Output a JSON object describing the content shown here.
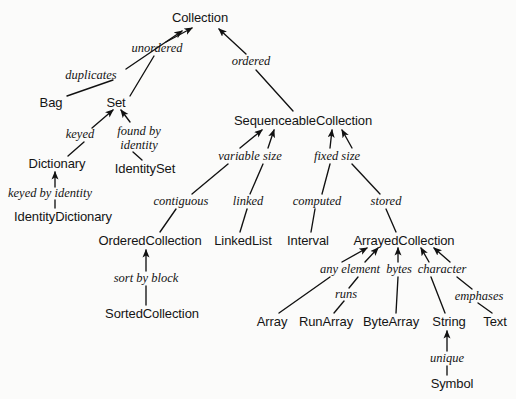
{
  "diagram": {
    "type": "tree-graph",
    "stroke_color": "#111111",
    "text_color": "#141414",
    "background_color": "#fbfbfa",
    "nodes": [
      {
        "id": "collection",
        "label": "Collection",
        "x": 200,
        "y": 17
      },
      {
        "id": "bag",
        "label": "Bag",
        "x": 51,
        "y": 102
      },
      {
        "id": "set",
        "label": "Set",
        "x": 116,
        "y": 102
      },
      {
        "id": "dictionary",
        "label": "Dictionary",
        "x": 57,
        "y": 163
      },
      {
        "id": "identityset",
        "label": "IdentitySet",
        "x": 145,
        "y": 168
      },
      {
        "id": "identitydictionary",
        "label": "IdentityDictionary",
        "x": 63,
        "y": 216
      },
      {
        "id": "sequenceablecollection",
        "label": "SequenceableCollection",
        "x": 303,
        "y": 120
      },
      {
        "id": "orderedcollection",
        "label": "OrderedCollection",
        "x": 150,
        "y": 240
      },
      {
        "id": "sortedcollection",
        "label": "SortedCollection",
        "x": 152,
        "y": 313
      },
      {
        "id": "linkedlist",
        "label": "LinkedList",
        "x": 243,
        "y": 240
      },
      {
        "id": "interval",
        "label": "Interval",
        "x": 308,
        "y": 240
      },
      {
        "id": "arrayedcollection",
        "label": "ArrayedCollection",
        "x": 404,
        "y": 240
      },
      {
        "id": "array",
        "label": "Array",
        "x": 272,
        "y": 321
      },
      {
        "id": "runarray",
        "label": "RunArray",
        "x": 326,
        "y": 321
      },
      {
        "id": "bytearray",
        "label": "ByteArray",
        "x": 391,
        "y": 321
      },
      {
        "id": "string",
        "label": "String",
        "x": 449,
        "y": 321
      },
      {
        "id": "text",
        "label": "Text",
        "x": 495,
        "y": 321
      },
      {
        "id": "symbol",
        "label": "Symbol",
        "x": 452,
        "y": 383
      }
    ],
    "edge_labels": [
      {
        "id": "duplicates",
        "label": "duplicates",
        "x": 91,
        "y": 75
      },
      {
        "id": "unordered",
        "label": "unordered",
        "x": 157,
        "y": 48
      },
      {
        "id": "ordered",
        "label": "ordered",
        "x": 251,
        "y": 61
      },
      {
        "id": "keyed",
        "label": "keyed",
        "x": 80,
        "y": 134
      },
      {
        "id": "found-by-identity",
        "label": "found by\nidentity",
        "x": 139,
        "y": 138
      },
      {
        "id": "keyed-by-identity",
        "label": "keyed by identity",
        "x": 50,
        "y": 193
      },
      {
        "id": "variable-size",
        "label": "variable size",
        "x": 250,
        "y": 156
      },
      {
        "id": "fixed-size",
        "label": "fixed size",
        "x": 337,
        "y": 156
      },
      {
        "id": "contiguous",
        "label": "contiguous",
        "x": 181,
        "y": 201
      },
      {
        "id": "linked",
        "label": "linked",
        "x": 248,
        "y": 201
      },
      {
        "id": "computed",
        "label": "computed",
        "x": 317,
        "y": 201
      },
      {
        "id": "stored",
        "label": "stored",
        "x": 386,
        "y": 201
      },
      {
        "id": "sort-by-block",
        "label": "sort by block",
        "x": 146,
        "y": 278
      },
      {
        "id": "any-element",
        "label": "any element",
        "x": 350,
        "y": 269
      },
      {
        "id": "bytes",
        "label": "bytes",
        "x": 399,
        "y": 269
      },
      {
        "id": "character",
        "label": "character",
        "x": 442,
        "y": 269
      },
      {
        "id": "runs",
        "label": "runs",
        "x": 346,
        "y": 294
      },
      {
        "id": "emphases",
        "label": "emphases",
        "x": 479,
        "y": 296
      },
      {
        "id": "unique",
        "label": "unique",
        "x": 447,
        "y": 358
      }
    ],
    "edges": [
      {
        "id": "bag-duplicates",
        "from": "bag",
        "to": "duplicates-label",
        "arrow": false,
        "x1": 67,
        "y1": 96,
        "x2": 113,
        "y2": 80
      },
      {
        "id": "duplicates-collection",
        "from": "duplicates",
        "to": "collection",
        "arrow": true,
        "x1": 126,
        "y1": 69,
        "x2": 182,
        "y2": 31
      },
      {
        "id": "set-unordered",
        "from": "set",
        "to": "unordered-label",
        "arrow": false,
        "x1": 130,
        "y1": 96,
        "x2": 154,
        "y2": 56
      },
      {
        "id": "unordered-collection",
        "from": "unordered",
        "to": "collection",
        "arrow": true,
        "x1": 166,
        "y1": 42,
        "x2": 192,
        "y2": 28
      },
      {
        "id": "sequenceable-ordered",
        "from": "sequenceablecollection",
        "to": "ordered-label",
        "arrow": false,
        "x1": 293,
        "y1": 111,
        "x2": 256,
        "y2": 70
      },
      {
        "id": "ordered-collection",
        "from": "ordered",
        "to": "collection",
        "arrow": true,
        "x1": 246,
        "y1": 54,
        "x2": 219,
        "y2": 29
      },
      {
        "id": "dictionary-keyed",
        "from": "dictionary",
        "to": "keyed-label",
        "arrow": false,
        "x1": 68,
        "y1": 156,
        "x2": 84,
        "y2": 142
      },
      {
        "id": "keyed-set",
        "from": "keyed",
        "to": "set",
        "arrow": true,
        "x1": 92,
        "y1": 128,
        "x2": 113,
        "y2": 110
      },
      {
        "id": "identityset-found",
        "from": "identityset",
        "to": "found-by-identity",
        "arrow": false,
        "x1": 142,
        "y1": 160,
        "x2": 133,
        "y2": 152
      },
      {
        "id": "found-set",
        "from": "found-by-identity",
        "to": "set",
        "arrow": true,
        "x1": 130,
        "y1": 122,
        "x2": 121,
        "y2": 110
      },
      {
        "id": "identitydict-label",
        "from": "identitydictionary",
        "to": "keyed-by-identity",
        "arrow": false,
        "x1": 55,
        "y1": 208,
        "x2": 55,
        "y2": 200
      },
      {
        "id": "keyedbyidentity-dictionary",
        "from": "keyed-by-identity",
        "to": "dictionary",
        "arrow": true,
        "x1": 55,
        "y1": 187,
        "x2": 55,
        "y2": 172
      },
      {
        "id": "contiguous-variablesize",
        "from": "contiguous",
        "to": "variable-size",
        "arrow": false,
        "x1": 192,
        "y1": 194,
        "x2": 228,
        "y2": 164
      },
      {
        "id": "variablesize-sequenceable",
        "from": "variable-size",
        "to": "sequenceablecollection",
        "arrow": true,
        "x1": 240,
        "y1": 148,
        "x2": 262,
        "y2": 130
      },
      {
        "id": "linked-variablesize2",
        "from": "linked",
        "to": "variable-size2",
        "arrow": false,
        "x1": 250,
        "y1": 194,
        "x2": 263,
        "y2": 164
      },
      {
        "id": "variablesize2-sequenceable",
        "from": "variable-size",
        "to": "sequenceablecollection",
        "arrow": true,
        "x1": 268,
        "y1": 148,
        "x2": 274,
        "y2": 130
      },
      {
        "id": "computed-fixedsize",
        "from": "computed",
        "to": "fixed-size",
        "arrow": false,
        "x1": 322,
        "y1": 194,
        "x2": 330,
        "y2": 164
      },
      {
        "id": "fixedsize-sequenceable",
        "from": "fixed-size",
        "to": "sequenceablecollection",
        "arrow": true,
        "x1": 330,
        "y1": 148,
        "x2": 332,
        "y2": 130
      },
      {
        "id": "stored-fixedsize",
        "from": "stored",
        "to": "fixed-size2",
        "arrow": false,
        "x1": 380,
        "y1": 194,
        "x2": 352,
        "y2": 164
      },
      {
        "id": "fixedsize2-sequenceable",
        "from": "fixed-size",
        "to": "sequenceablecollection",
        "arrow": true,
        "x1": 352,
        "y1": 148,
        "x2": 342,
        "y2": 130
      },
      {
        "id": "orderedcollection-contiguous",
        "from": "orderedcollection",
        "to": "contiguous",
        "arrow": false,
        "x1": 160,
        "y1": 232,
        "x2": 176,
        "y2": 209
      },
      {
        "id": "linkedlist-linked",
        "from": "linkedlist",
        "to": "linked",
        "arrow": false,
        "x1": 240,
        "y1": 232,
        "x2": 247,
        "y2": 209
      },
      {
        "id": "interval-computed",
        "from": "interval",
        "to": "computed",
        "arrow": false,
        "x1": 311,
        "y1": 232,
        "x2": 315,
        "y2": 209
      },
      {
        "id": "arrayedcollection-stored",
        "from": "arrayedcollection",
        "to": "stored",
        "arrow": false,
        "x1": 396,
        "y1": 232,
        "x2": 386,
        "y2": 209
      },
      {
        "id": "sortedcollection-sortbyblock",
        "from": "sortedcollection",
        "to": "sort-by-block",
        "arrow": false,
        "x1": 146,
        "y1": 305,
        "x2": 146,
        "y2": 286
      },
      {
        "id": "sortbyblock-orderedcollection",
        "from": "sort-by-block",
        "to": "orderedcollection",
        "arrow": true,
        "x1": 146,
        "y1": 271,
        "x2": 146,
        "y2": 250
      },
      {
        "id": "array-anyelement",
        "from": "array",
        "to": "any-element",
        "arrow": false,
        "x1": 279,
        "y1": 313,
        "x2": 330,
        "y2": 277
      },
      {
        "id": "anyelement-arrayed",
        "from": "any-element",
        "to": "arrayedcollection",
        "arrow": true,
        "x1": 342,
        "y1": 262,
        "x2": 367,
        "y2": 248
      },
      {
        "id": "runarray-runs",
        "from": "runarray",
        "to": "runs",
        "arrow": false,
        "x1": 334,
        "y1": 313,
        "x2": 344,
        "y2": 301
      },
      {
        "id": "runs-anyelement",
        "from": "runs",
        "to": "any-element-right",
        "arrow": false,
        "x1": 349,
        "y1": 288,
        "x2": 358,
        "y2": 277
      },
      {
        "id": "anyelement2-arrayed",
        "from": "any-element",
        "to": "arrayedcollection",
        "arrow": true,
        "x1": 365,
        "y1": 262,
        "x2": 378,
        "y2": 248
      },
      {
        "id": "bytearray-bytes",
        "from": "bytearray",
        "to": "bytes",
        "arrow": false,
        "x1": 396,
        "y1": 313,
        "x2": 398,
        "y2": 277
      },
      {
        "id": "bytes-arrayed",
        "from": "bytes",
        "to": "arrayedcollection",
        "arrow": true,
        "x1": 398,
        "y1": 262,
        "x2": 398,
        "y2": 248
      },
      {
        "id": "string-character",
        "from": "string",
        "to": "character",
        "arrow": false,
        "x1": 445,
        "y1": 313,
        "x2": 431,
        "y2": 277
      },
      {
        "id": "character-arrayed",
        "from": "character",
        "to": "arrayedcollection",
        "arrow": true,
        "x1": 429,
        "y1": 262,
        "x2": 421,
        "y2": 248
      },
      {
        "id": "text-emphases",
        "from": "text",
        "to": "emphases",
        "arrow": false,
        "x1": 492,
        "y1": 313,
        "x2": 478,
        "y2": 303
      },
      {
        "id": "emphases-character",
        "from": "emphases",
        "to": "character-right",
        "arrow": false,
        "x1": 472,
        "y1": 289,
        "x2": 457,
        "y2": 277
      },
      {
        "id": "character2-arrayed",
        "from": "character",
        "to": "arrayedcollection",
        "arrow": true,
        "x1": 450,
        "y1": 262,
        "x2": 434,
        "y2": 248
      },
      {
        "id": "symbol-unique",
        "from": "symbol",
        "to": "unique",
        "arrow": false,
        "x1": 447,
        "y1": 375,
        "x2": 447,
        "y2": 366
      },
      {
        "id": "unique-string",
        "from": "unique",
        "to": "string",
        "arrow": true,
        "x1": 447,
        "y1": 351,
        "x2": 447,
        "y2": 331
      }
    ]
  }
}
